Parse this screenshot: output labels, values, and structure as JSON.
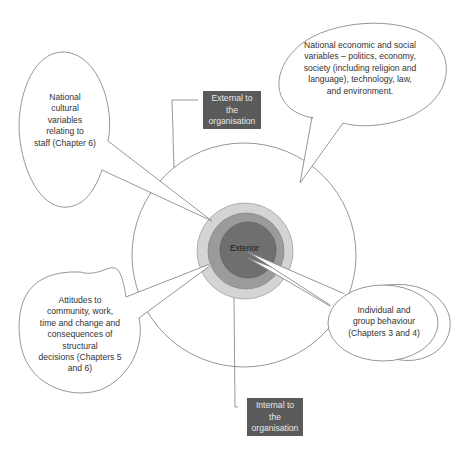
{
  "diagram": {
    "type": "concentric-circles-with-callouts",
    "center_label": "Exterior",
    "boxes": {
      "external": "External to the organisation",
      "internal": "Internal to the organisation"
    },
    "box_lines": {
      "external": [
        "External to",
        "the",
        "organisation"
      ],
      "internal": [
        "Internal to",
        "the",
        "organisation"
      ]
    },
    "callouts": {
      "national_economic": {
        "lines": [
          "National economic and social",
          "variables – politics, economy,",
          "society (including religion and",
          "language), technology, law,",
          "and environment."
        ]
      },
      "national_cultural": {
        "lines": [
          "National",
          "cultural",
          "variables",
          "relating to",
          "staff (Chapter 6)"
        ]
      },
      "attitudes": {
        "lines": [
          "Attitudes to",
          "community, work,",
          "time and change and",
          "consequences of",
          "structural",
          "decisions (Chapters 5",
          "and 6)"
        ]
      },
      "individual_group": {
        "lines": [
          "Individual and",
          "group behaviour",
          "(Chapters 3 and 4)"
        ]
      }
    },
    "colors": {
      "outer_ring": "#d4d4d4",
      "middle_ring": "#9b9b9b",
      "inner_circle": "#6f6f6f",
      "box_fill": "#5a5a5a",
      "line": "#7a7a7a"
    }
  }
}
